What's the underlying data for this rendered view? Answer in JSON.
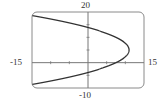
{
  "chart_data": {
    "type": "line",
    "title": "",
    "xlabel": "",
    "ylabel": "",
    "xlim": [
      -15,
      15
    ],
    "ylim": [
      -10,
      20
    ],
    "grid": false,
    "legend": null,
    "window_labels": {
      "xmin": "-15",
      "xmax": "15",
      "ymin": "-10",
      "ymax": "20"
    },
    "x_tick_step": 5,
    "y_tick_step": 5,
    "series": [
      {
        "name": "parabola opening left",
        "description": "Sideways parabola with vertex near (11, 5), opening to the left",
        "vertex": [
          11,
          5
        ],
        "equation_approx": "x = 11 - 0.14*(y - 5)^2",
        "x": [
          -15,
          -10,
          -5,
          0,
          5,
          7.5,
          10,
          11,
          10,
          7.5,
          5,
          0,
          -5,
          -10,
          -15
        ],
        "y": [
          18.6,
          17.2,
          15.7,
          13.9,
          11.5,
          10.0,
          7.7,
          5,
          2.3,
          0.0,
          -1.5,
          -3.9,
          -5.7,
          -7.2,
          -8.6
        ]
      }
    ]
  },
  "colors": {
    "curve": "#333333",
    "frame": "#888888",
    "axes": "#777777",
    "text": "#333333"
  }
}
